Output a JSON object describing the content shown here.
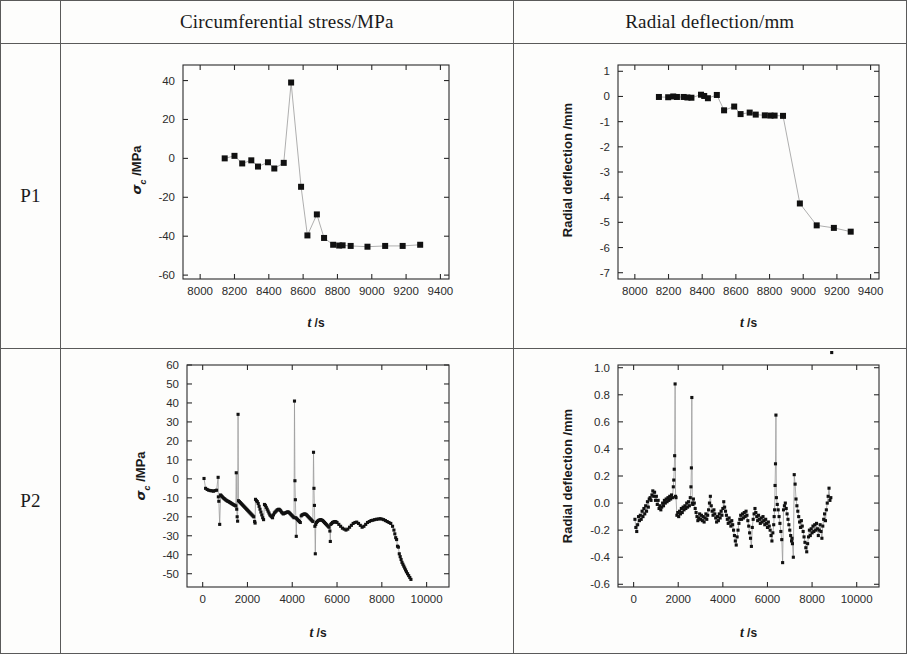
{
  "table": {
    "corner_label": "",
    "columns": [
      {
        "id": "label",
        "header": ""
      },
      {
        "id": "stress",
        "header": "Circumferential stress/MPa"
      },
      {
        "id": "deflection",
        "header": "Radial deflection/mm"
      }
    ],
    "rows": [
      {
        "label": "P1"
      },
      {
        "label": "P2"
      }
    ]
  },
  "chart_data": [
    {
      "id": "p1-stress",
      "type": "scatter",
      "title": "",
      "xlabel": "t /s",
      "ylabel": "σ c /MPa",
      "ylabel_symbol": "σ",
      "ylabel_sub": "c",
      "ylabel_unit": "/MPa",
      "xlim": [
        7900,
        9450
      ],
      "ylim": [
        -62,
        48
      ],
      "xticks": [
        8000,
        8200,
        8400,
        8600,
        8800,
        9000,
        9200,
        9400
      ],
      "yticks": [
        -60,
        -40,
        -20,
        0,
        20,
        40
      ],
      "xticklabels": [
        "8000",
        "8200",
        "8400",
        "8600",
        "8800",
        "9000",
        "9200",
        "9400"
      ],
      "yticklabels": [
        "-60",
        "-40",
        "-20",
        "0",
        "20",
        "40"
      ],
      "grid": false,
      "legend": "none",
      "marker": "square",
      "x": [
        8143,
        8200,
        8245,
        8298,
        8337,
        8395,
        8432,
        8487,
        8530,
        8588,
        8625,
        8680,
        8722,
        8775,
        8810,
        8830,
        8877,
        8975,
        9078,
        9180,
        9282
      ],
      "y": [
        0.0,
        1.3,
        -2.6,
        -1.0,
        -4.2,
        -2.0,
        -5.2,
        -2.3,
        39.0,
        -14.6,
        -39.6,
        -28.8,
        -40.9,
        -44.4,
        -44.8,
        -44.7,
        -45.0,
        -45.4,
        -45.0,
        -45.0,
        -44.4
      ]
    },
    {
      "id": "p1-deflection",
      "type": "scatter",
      "title": "",
      "xlabel": "t /s",
      "ylabel": "Radial deflection /mm",
      "xlim": [
        7900,
        9450
      ],
      "ylim": [
        -7.25,
        1.25
      ],
      "xticks": [
        8000,
        8200,
        8400,
        8600,
        8800,
        9000,
        9200,
        9400
      ],
      "yticks": [
        -7,
        -6,
        -5,
        -4,
        -3,
        -2,
        -1,
        0,
        1
      ],
      "xticklabels": [
        "8000",
        "8200",
        "8400",
        "8600",
        "8800",
        "9000",
        "9200",
        "9400"
      ],
      "yticklabels": [
        "-7",
        "-6",
        "-5",
        "-4",
        "-3",
        "-2",
        "-1",
        "0",
        "1"
      ],
      "grid": false,
      "legend": "none",
      "marker": "square",
      "x": [
        8143,
        8198,
        8228,
        8250,
        8290,
        8312,
        8336,
        8393,
        8412,
        8434,
        8487,
        8530,
        8590,
        8628,
        8682,
        8718,
        8772,
        8806,
        8830,
        8880,
        8980,
        9080,
        9182,
        9282
      ],
      "y": [
        -0.02,
        -0.03,
        0.0,
        -0.02,
        -0.02,
        -0.04,
        -0.05,
        0.07,
        0.02,
        -0.07,
        0.06,
        -0.55,
        -0.4,
        -0.7,
        -0.64,
        -0.72,
        -0.75,
        -0.76,
        -0.76,
        -0.77,
        -4.25,
        -5.12,
        -5.22,
        -5.37
      ]
    },
    {
      "id": "p2-stress",
      "type": "scatter",
      "title": "",
      "xlabel": "t /s",
      "ylabel": "σ c /MPa",
      "ylabel_symbol": "σ",
      "ylabel_sub": "c",
      "ylabel_unit": "/MPa",
      "xlim": [
        -700,
        11000
      ],
      "ylim": [
        -57,
        60
      ],
      "xticks": [
        0,
        2000,
        4000,
        6000,
        8000,
        10000
      ],
      "yticks": [
        -50,
        -40,
        -30,
        -20,
        -10,
        0,
        10,
        20,
        30,
        40,
        50,
        60
      ],
      "xticklabels": [
        "0",
        "2000",
        "4000",
        "6000",
        "8000",
        "10000"
      ],
      "yticklabels": [
        "-50",
        "-40",
        "-30",
        "-20",
        "-10",
        "0",
        "10",
        "20",
        "30",
        "40",
        "50",
        "60"
      ],
      "grid": false,
      "legend": "none",
      "marker": "square",
      "x": [
        60,
        130,
        200,
        270,
        340,
        410,
        480,
        550,
        620,
        690,
        700,
        720,
        760,
        800,
        840,
        880,
        920,
        960,
        1000,
        1040,
        1080,
        1120,
        1160,
        1200,
        1240,
        1280,
        1320,
        1360,
        1400,
        1440,
        1480,
        1500,
        1520,
        1540,
        1560,
        1580,
        1600,
        1640,
        1680,
        1720,
        1760,
        1800,
        1840,
        1880,
        1920,
        1960,
        2000,
        2040,
        2080,
        2120,
        2160,
        2200,
        2240,
        2280,
        2320,
        2340,
        2360,
        2400,
        2440,
        2480,
        2520,
        2560,
        2600,
        2640,
        2680,
        2720,
        2760,
        2800,
        2840,
        2880,
        2920,
        2960,
        3000,
        3040,
        3080,
        3120,
        3160,
        3200,
        3240,
        3280,
        3320,
        3360,
        3400,
        3440,
        3480,
        3520,
        3560,
        3600,
        3640,
        3680,
        3720,
        3760,
        3800,
        3840,
        3880,
        3920,
        3960,
        4000,
        4040,
        4080,
        4100,
        4120,
        4140,
        4160,
        4180,
        4200,
        4240,
        4280,
        4320,
        4360,
        4400,
        4440,
        4480,
        4520,
        4560,
        4600,
        4640,
        4680,
        4720,
        4760,
        4800,
        4840,
        4880,
        4920,
        4950,
        4970,
        4990,
        5010,
        5030,
        5050,
        5080,
        5120,
        5160,
        5200,
        5240,
        5280,
        5320,
        5360,
        5400,
        5440,
        5480,
        5520,
        5560,
        5600,
        5640,
        5680,
        5700,
        5720,
        5760,
        5800,
        5840,
        5880,
        5920,
        5960,
        6000,
        6080,
        6160,
        6240,
        6320,
        6400,
        6480,
        6560,
        6640,
        6720,
        6800,
        6880,
        6960,
        7040,
        7120,
        7200,
        7280,
        7360,
        7440,
        7520,
        7600,
        7680,
        7760,
        7840,
        7920,
        8000,
        8080,
        8160,
        8240,
        8320,
        8400,
        8480,
        8540,
        8580,
        8620,
        8660,
        8700,
        8740,
        8780,
        8820,
        8860,
        8900,
        8940,
        8980,
        9020,
        9060,
        9100,
        9150,
        9200,
        9250,
        9300
      ],
      "y": [
        0.2,
        -5.0,
        -5.6,
        -6.0,
        -6.2,
        -6.3,
        -6.5,
        -6.2,
        -6.0,
        0.8,
        -9.5,
        -11.8,
        -24.0,
        -8.5,
        -9.0,
        -9.5,
        -10.0,
        -10.4,
        -10.8,
        -11.2,
        -11.5,
        -11.8,
        -12.0,
        -12.3,
        -12.6,
        -12.9,
        -13.2,
        -13.5,
        -13.8,
        -14.0,
        -14.3,
        3.2,
        -16.0,
        -20.0,
        -22.3,
        34.0,
        -11.5,
        -12.0,
        -12.5,
        -13.0,
        -13.5,
        -14.0,
        -14.5,
        -15.0,
        -15.5,
        -16.0,
        -16.5,
        -17.0,
        -17.5,
        -18.0,
        -18.5,
        -19.0,
        -19.5,
        -20.0,
        -22.5,
        -23.3,
        -10.8,
        -11.5,
        -12.0,
        -13.0,
        -14.5,
        -16.0,
        -17.5,
        -19.0,
        -20.5,
        -21.5,
        -13.5,
        -14.0,
        -15.0,
        -16.0,
        -17.0,
        -18.0,
        -19.0,
        -19.5,
        -20.0,
        -20.5,
        -19.0,
        -18.0,
        -17.5,
        -17.0,
        -16.5,
        -16.2,
        -16.0,
        -16.3,
        -16.8,
        -17.5,
        -18.0,
        -18.5,
        -18.2,
        -18.0,
        -17.8,
        -17.6,
        -17.4,
        -17.6,
        -18.0,
        -18.5,
        -19.0,
        -19.5,
        -20.0,
        -20.5,
        41.0,
        -1.0,
        -11.0,
        -20.5,
        -30.3,
        -21.0,
        -21.5,
        -22.0,
        -22.5,
        -23.0,
        -19.5,
        -19.0,
        -18.8,
        -18.6,
        -18.5,
        -18.7,
        -19.0,
        -19.5,
        -20.0,
        -20.5,
        -21.0,
        -21.5,
        -22.0,
        -22.5,
        14.0,
        -5.0,
        -14.0,
        -25.0,
        -39.5,
        -24.0,
        -23.0,
        -22.5,
        -22.0,
        -21.8,
        -21.6,
        -21.5,
        -21.8,
        -22.0,
        -22.5,
        -23.0,
        -23.5,
        -24.0,
        -24.5,
        -25.0,
        -25.5,
        -27.5,
        -33.0,
        -24.0,
        -23.5,
        -23.0,
        -22.8,
        -22.6,
        -22.5,
        -22.8,
        -23.0,
        -24.0,
        -25.0,
        -26.0,
        -26.5,
        -27.0,
        -26.5,
        -25.5,
        -24.5,
        -23.5,
        -23.0,
        -22.8,
        -23.5,
        -24.5,
        -25.5,
        -25.0,
        -24.0,
        -23.0,
        -22.5,
        -22.0,
        -21.8,
        -21.5,
        -21.3,
        -21.2,
        -21.0,
        -21.2,
        -21.5,
        -22.0,
        -22.5,
        -23.0,
        -23.5,
        -25.0,
        -27.0,
        -29.0,
        -31.0,
        -32.0,
        -35.5,
        -36.0,
        -39.5,
        -41.0,
        -42.5,
        -44.0,
        -45.0,
        -46.0,
        -47.0,
        -48.0,
        -49.0,
        -50.0,
        -51.0,
        -52.0,
        -53.0,
        -53.5
      ]
    },
    {
      "id": "p2-deflection",
      "type": "scatter",
      "title": "",
      "xlabel": "t /s",
      "ylabel": "Radial deflection /mm",
      "xlim": [
        -700,
        11000
      ],
      "ylim": [
        -0.62,
        1.02
      ],
      "xticks": [
        0,
        2000,
        4000,
        6000,
        8000,
        10000
      ],
      "yticks": [
        -0.6,
        -0.4,
        -0.2,
        0.0,
        0.2,
        0.4,
        0.6,
        0.8,
        1.0
      ],
      "xticklabels": [
        "0",
        "2000",
        "4000",
        "6000",
        "8000",
        "10000"
      ],
      "yticklabels": [
        "-0.6",
        "-0.4",
        "-0.2",
        "0.0",
        "0.2",
        "0.4",
        "0.6",
        "0.8",
        "1.0"
      ],
      "grid": false,
      "legend": "none",
      "marker": "square",
      "x": [
        60,
        100,
        140,
        180,
        220,
        260,
        300,
        340,
        380,
        420,
        460,
        500,
        540,
        580,
        620,
        660,
        700,
        740,
        780,
        820,
        860,
        900,
        940,
        980,
        1020,
        1060,
        1100,
        1140,
        1180,
        1220,
        1260,
        1300,
        1340,
        1380,
        1420,
        1460,
        1500,
        1540,
        1580,
        1620,
        1660,
        1700,
        1740,
        1780,
        1800,
        1820,
        1840,
        1860,
        1880,
        1900,
        1940,
        1980,
        2020,
        2060,
        2100,
        2140,
        2180,
        2220,
        2260,
        2300,
        2340,
        2380,
        2420,
        2460,
        2500,
        2540,
        2570,
        2590,
        2610,
        2630,
        2650,
        2680,
        2720,
        2760,
        2800,
        2840,
        2880,
        2920,
        2960,
        3000,
        3040,
        3080,
        3120,
        3160,
        3200,
        3240,
        3280,
        3320,
        3360,
        3400,
        3440,
        3480,
        3520,
        3560,
        3600,
        3640,
        3680,
        3720,
        3760,
        3800,
        3840,
        3880,
        3920,
        3960,
        4000,
        4040,
        4080,
        4120,
        4160,
        4200,
        4240,
        4280,
        4320,
        4360,
        4400,
        4440,
        4480,
        4520,
        4560,
        4600,
        4640,
        4680,
        4720,
        4760,
        4800,
        4840,
        4880,
        4920,
        4960,
        5000,
        5040,
        5080,
        5120,
        5160,
        5200,
        5240,
        5280,
        5320,
        5360,
        5400,
        5440,
        5480,
        5520,
        5560,
        5600,
        5640,
        5680,
        5720,
        5760,
        5800,
        5840,
        5880,
        5920,
        5960,
        6000,
        6040,
        6080,
        6120,
        6160,
        6200,
        6240,
        6280,
        6300,
        6320,
        6340,
        6360,
        6380,
        6400,
        6440,
        6480,
        6520,
        6560,
        6600,
        6640,
        6680,
        6720,
        6760,
        6800,
        6840,
        6880,
        6920,
        6960,
        7000,
        7040,
        7080,
        7100,
        7120,
        7160,
        7200,
        7240,
        7280,
        7320,
        7360,
        7400,
        7440,
        7480,
        7520,
        7560,
        7600,
        7640,
        7680,
        7720,
        7760,
        7800,
        7840,
        7880,
        7920,
        7960,
        8000,
        8040,
        8080,
        8120,
        8160,
        8200,
        8240,
        8280,
        8320,
        8360,
        8400,
        8440,
        8480,
        8520,
        8560,
        8600,
        8640,
        8680,
        8720,
        8760,
        8800,
        8840,
        8880
      ],
      "y": [
        -0.12,
        -0.18,
        -0.21,
        -0.16,
        -0.1,
        -0.13,
        -0.09,
        -0.12,
        -0.06,
        -0.1,
        -0.04,
        -0.08,
        -0.02,
        -0.06,
        0.01,
        -0.03,
        0.03,
        0.04,
        0.02,
        0.06,
        0.09,
        0.05,
        0.08,
        0.02,
        0.05,
        -0.01,
        0.02,
        -0.04,
        -0.02,
        -0.05,
        -0.03,
        0.0,
        -0.02,
        0.02,
        0.0,
        0.03,
        0.01,
        0.04,
        0.02,
        0.05,
        0.03,
        0.06,
        0.04,
        0.12,
        0.17,
        0.25,
        0.35,
        0.88,
        0.05,
        0.04,
        -0.09,
        -0.07,
        -0.1,
        -0.06,
        -0.08,
        -0.04,
        -0.07,
        -0.03,
        -0.05,
        -0.02,
        -0.04,
        0.0,
        -0.03,
        0.01,
        -0.02,
        0.04,
        0.12,
        0.26,
        0.78,
        0.0,
        -0.01,
        0.03,
        0.0,
        -0.04,
        -0.07,
        -0.1,
        -0.13,
        -0.11,
        -0.08,
        -0.12,
        -0.09,
        -0.13,
        -0.1,
        -0.14,
        -0.11,
        -0.08,
        -0.12,
        -0.09,
        -0.05,
        0.0,
        0.05,
        -0.02,
        -0.06,
        -0.09,
        -0.05,
        -0.08,
        -0.11,
        -0.14,
        -0.1,
        -0.13,
        -0.08,
        -0.11,
        -0.06,
        -0.09,
        -0.04,
        0.01,
        -0.03,
        -0.06,
        -0.09,
        -0.12,
        -0.15,
        -0.11,
        -0.14,
        -0.17,
        -0.13,
        -0.16,
        -0.2,
        -0.24,
        -0.28,
        -0.31,
        -0.25,
        -0.2,
        -0.15,
        -0.12,
        -0.09,
        -0.12,
        -0.08,
        -0.11,
        -0.07,
        -0.1,
        -0.06,
        -0.09,
        -0.13,
        -0.17,
        -0.22,
        -0.26,
        -0.32,
        -0.18,
        -0.12,
        -0.08,
        -0.04,
        -0.07,
        -0.1,
        -0.13,
        -0.09,
        -0.12,
        -0.15,
        -0.11,
        -0.14,
        -0.1,
        -0.13,
        -0.16,
        -0.12,
        -0.15,
        -0.18,
        -0.14,
        -0.17,
        -0.2,
        -0.24,
        -0.28,
        -0.22,
        -0.16,
        -0.1,
        -0.05,
        0.13,
        0.29,
        0.65,
        0.04,
        -0.01,
        -0.05,
        -0.1,
        -0.15,
        -0.21,
        -0.27,
        -0.44,
        -0.05,
        -0.02,
        0.0,
        -0.04,
        -0.08,
        -0.12,
        -0.16,
        -0.2,
        -0.24,
        -0.28,
        -0.26,
        -0.3,
        -0.4,
        0.21,
        0.14,
        0.03,
        -0.02,
        -0.06,
        -0.1,
        -0.14,
        -0.18,
        -0.13,
        -0.17,
        -0.21,
        -0.25,
        -0.29,
        -0.33,
        -0.36,
        -0.3,
        -0.25,
        -0.2,
        -0.24,
        -0.19,
        -0.22,
        -0.17,
        -0.21,
        -0.16,
        -0.2,
        -0.15,
        -0.19,
        -0.24,
        -0.2,
        -0.16,
        -0.21,
        -0.26,
        -0.17,
        -0.12,
        -0.08,
        -0.13,
        -0.05,
        0.0,
        0.05,
        0.11,
        0.02,
        0.04
      ]
    }
  ]
}
